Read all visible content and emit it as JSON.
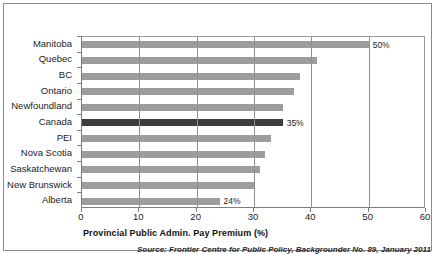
{
  "figure": {
    "axis_title": "Provincial Public Admin. Pay Premium (%)",
    "source_note": "Source: Frontier Centre for Public Policy, Backgrounder No. 89, January 2011"
  },
  "colors": {
    "bar": "#9d9d9d",
    "bar_highlight": "#3d3d3d",
    "axis": "#7d7d7d",
    "gridline": "#8f8f8f",
    "text": "#1c1c1c"
  },
  "chart_data": {
    "type": "bar",
    "orientation": "horizontal",
    "title": "",
    "xlabel": "Provincial Public Admin. Pay Premium (%)",
    "ylabel": "",
    "xlim": [
      0,
      60
    ],
    "xticks": [
      0,
      10,
      20,
      30,
      40,
      50,
      60
    ],
    "grid": true,
    "grid_axis": "x",
    "legend": false,
    "categories": [
      "Manitoba",
      "Quebec",
      "BC",
      "Ontario",
      "Newfoundland",
      "Canada",
      "PEI",
      "Nova Scotia",
      "Saskatchewan",
      "New Brunswick",
      "Alberta"
    ],
    "values": [
      50,
      41,
      38,
      37,
      35,
      35,
      33,
      32,
      31,
      30,
      24
    ],
    "highlighted_category": "Canada",
    "data_labels": [
      {
        "category": "Manitoba",
        "text": "50%"
      },
      {
        "category": "Canada",
        "text": "35%"
      },
      {
        "category": "Alberta",
        "text": "24%"
      }
    ]
  }
}
